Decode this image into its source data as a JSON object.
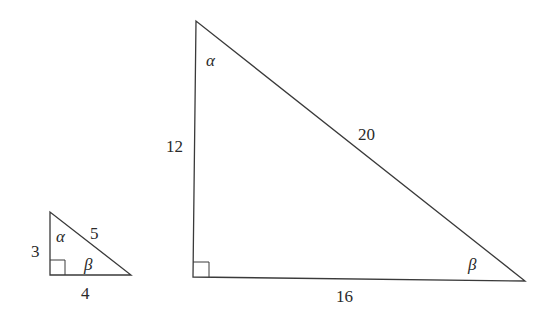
{
  "small_triangle": {
    "side_vertical": "3",
    "side_horizontal": "4",
    "hypotenuse": "5",
    "angle_top": "α",
    "angle_right": "β"
  },
  "large_triangle": {
    "side_vertical": "12",
    "side_horizontal": "16",
    "hypotenuse": "20",
    "angle_top": "α",
    "angle_right": "β"
  }
}
